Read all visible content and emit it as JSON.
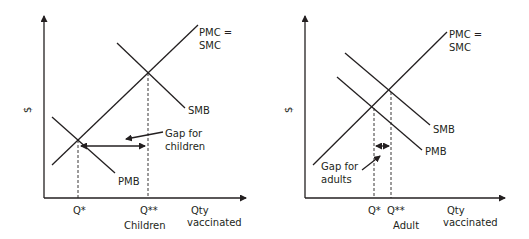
{
  "panels": [
    {
      "id": "children",
      "y_axis_label": "$",
      "x_axis_label_line1": "Qty",
      "x_axis_label_line2": "vaccinated",
      "group_label": "Children",
      "curves": {
        "supply_line1": "PMC =",
        "supply_line2": "SMC",
        "social_benefit": "SMB",
        "private_benefit": "PMB"
      },
      "q_star": "Q*",
      "q_double_star": "Q**",
      "gap_line1": "Gap for",
      "gap_line2": "children"
    },
    {
      "id": "adult",
      "y_axis_label": "$",
      "x_axis_label_line1": "Qty",
      "x_axis_label_line2": "vaccinated",
      "group_label": "Adult",
      "curves": {
        "supply_line1": "PMC =",
        "supply_line2": "SMC",
        "social_benefit": "SMB",
        "private_benefit": "PMB"
      },
      "q_star": "Q*",
      "q_double_star": "Q**",
      "gap_line1": "Gap for",
      "gap_line2": "adults"
    }
  ]
}
